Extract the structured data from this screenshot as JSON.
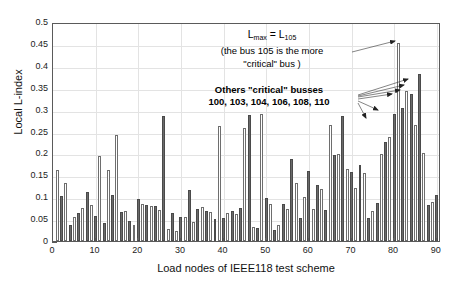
{
  "chart_data": {
    "type": "bar",
    "title": "",
    "xlabel": "Load nodes of IEEE118 test scheme",
    "ylabel": "Local L-index",
    "xlim": [
      0,
      91
    ],
    "ylim": [
      0,
      0.5
    ],
    "grid": true,
    "legend": null,
    "xticks": [
      0,
      10,
      20,
      30,
      40,
      50,
      60,
      70,
      80,
      90
    ],
    "yticks": [
      0,
      0.05,
      0.1,
      0.15,
      0.2,
      0.25,
      0.3,
      0.35,
      0.4,
      0.45,
      0.5
    ],
    "ytick_labels": [
      "0",
      "0.05",
      "0.1",
      "0.15",
      "0.2",
      "0.25",
      "0.3",
      "0.35",
      "0.4",
      "0.45",
      "0.5"
    ],
    "xtick_labels": [
      "0",
      "10",
      "20",
      "30",
      "40",
      "50",
      "60",
      "70",
      "80",
      "90"
    ],
    "x": [
      1,
      2,
      3,
      4,
      5,
      6,
      7,
      8,
      9,
      10,
      11,
      12,
      13,
      14,
      15,
      16,
      17,
      18,
      19,
      20,
      21,
      22,
      23,
      24,
      25,
      26,
      27,
      28,
      29,
      30,
      31,
      32,
      33,
      34,
      35,
      36,
      37,
      38,
      39,
      40,
      41,
      42,
      43,
      44,
      45,
      46,
      47,
      48,
      49,
      50,
      51,
      52,
      53,
      54,
      55,
      56,
      57,
      58,
      59,
      60,
      61,
      62,
      63,
      64,
      65,
      66,
      67,
      68,
      69,
      70,
      71,
      72,
      73,
      74,
      75,
      76,
      77,
      78,
      79,
      80,
      81,
      82,
      83,
      84,
      85,
      86,
      87,
      88,
      89,
      90
    ],
    "values": [
      0.161,
      0.102,
      0.132,
      0.037,
      0.055,
      0.063,
      0.076,
      0.111,
      0.082,
      0.058,
      0.193,
      0.042,
      0.163,
      0.105,
      0.241,
      0.067,
      0.069,
      0.045,
      0.037,
      0.097,
      0.085,
      0.082,
      0.079,
      0.081,
      0.07,
      0.285,
      0.028,
      0.063,
      0.024,
      0.054,
      0.055,
      0.117,
      0.043,
      0.073,
      0.078,
      0.068,
      0.066,
      0.051,
      0.263,
      0.052,
      0.064,
      0.068,
      0.061,
      0.076,
      0.257,
      0.288,
      0.032,
      0.029,
      0.289,
      0.098,
      0.084,
      0.025,
      0.036,
      0.085,
      0.072,
      0.187,
      0.133,
      0.053,
      0.101,
      0.159,
      0.074,
      0.127,
      0.119,
      0.071,
      0.266,
      0.196,
      0.199,
      0.286,
      0.165,
      0.158,
      0.122,
      0.173,
      0.156,
      0.052,
      0.069,
      0.087,
      0.198,
      0.227,
      0.237,
      0.289,
      0.452,
      0.304,
      0.342,
      0.336,
      0.264,
      0.381,
      0.201,
      0.082,
      0.088,
      0.105
    ],
    "bar_style": {
      "alternating": true,
      "light_fill": "#ffffff",
      "dark_fill": "#6a6a6a",
      "edge": "#6e6e6e"
    },
    "annotations": [
      {
        "name": "lmax-annotation",
        "line1_prefix": "L",
        "line1_sub1": "max",
        "line1_eq": " = L",
        "line1_sub2": "105",
        "line2": "(the bus 105 is the more",
        "line3": "\"critical\" bus )"
      },
      {
        "name": "others-annotation",
        "line1": "Others \"critical\" busses",
        "line2": "100, 103, 104, 106, 108, 110"
      }
    ],
    "max_value": 0.452,
    "max_bus": 105
  },
  "axes": {
    "ylabel": "Local L-index",
    "xlabel": "Load nodes of IEEE118 test scheme"
  },
  "colors": {
    "frame": "#5a5a5a",
    "grid": "#e3e3e3",
    "text": "#111111",
    "bar_dark": "#6a6a6a",
    "bar_light": "#ffffff",
    "background": "#ffffff"
  }
}
